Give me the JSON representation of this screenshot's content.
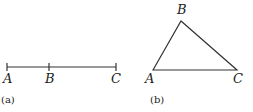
{
  "figure_a": {
    "caption": "(a)",
    "points": [
      {
        "label": "A",
        "x": 7
      },
      {
        "label": "B",
        "x": 49
      },
      {
        "label": "C",
        "x": 116
      }
    ]
  },
  "figure_b": {
    "caption": "(b)",
    "vertices": {
      "A": {
        "label": "A"
      },
      "B": {
        "label": "B"
      },
      "C": {
        "label": "C"
      }
    }
  },
  "colors": {
    "stroke": "#333333",
    "text": "#222222"
  }
}
